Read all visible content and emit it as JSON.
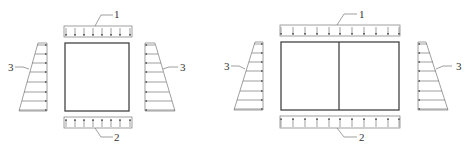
{
  "figures": [
    {
      "name": "single-cell-box",
      "cells": 1,
      "labels": {
        "top_load": "1",
        "bottom_load": "2",
        "left_pressure": "3",
        "right_pressure": "3"
      }
    },
    {
      "name": "double-cell-box",
      "cells": 2,
      "labels": {
        "top_load": "1",
        "bottom_load": "2",
        "left_pressure": "3",
        "right_pressure": "3"
      }
    }
  ],
  "legend": {
    "1": "top distributed load",
    "2": "bottom distributed reaction",
    "3": "lateral trapezoidal earth pressure"
  },
  "colors": {
    "line": "#555555",
    "background": "#ffffff"
  }
}
